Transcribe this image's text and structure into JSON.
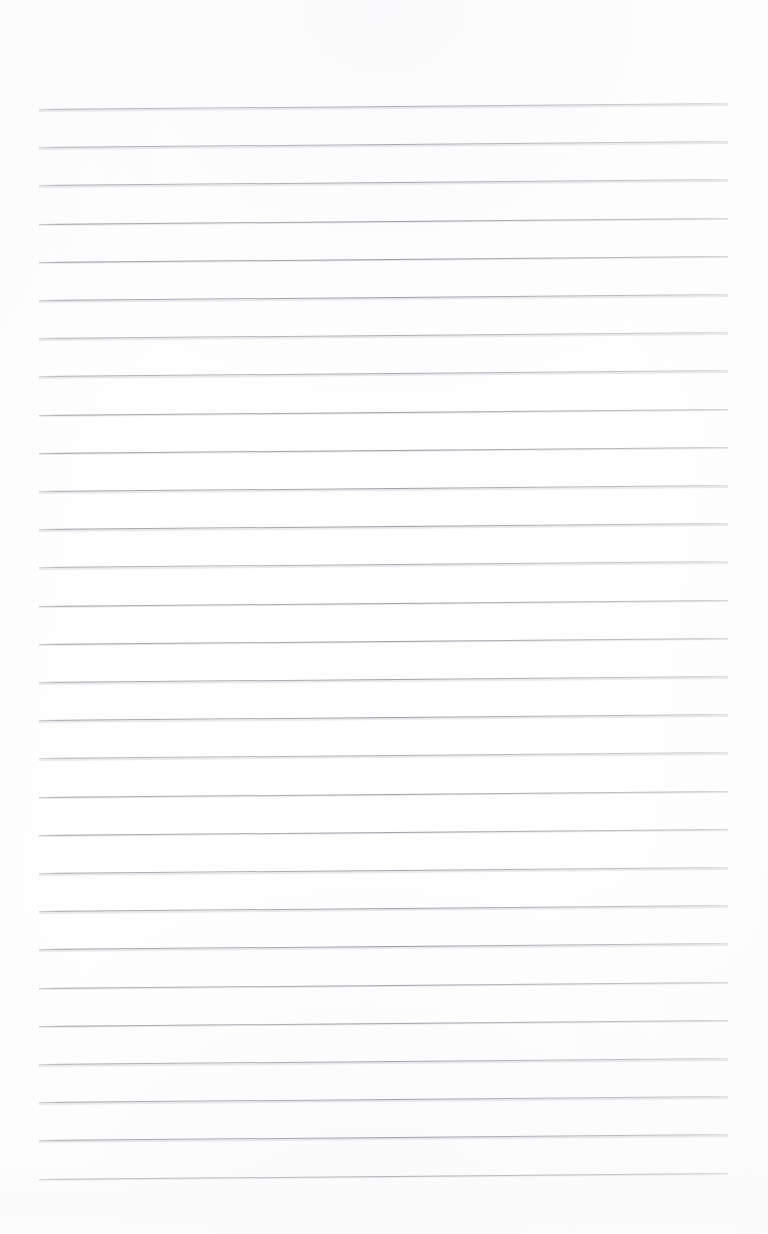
{
  "document": {
    "type": "scanned-ruled-paper",
    "title": "Blank ruled notebook page",
    "page_width": 768,
    "page_height": 1234,
    "background_color": "#fdfdfd",
    "content_text": "",
    "has_handwriting": false,
    "has_printed_text": false
  },
  "ruling": {
    "line_color": "#9c9ca6",
    "line_count": 29,
    "first_line_y": 109,
    "line_spacing": 38.2,
    "line_left_x": 39,
    "line_right_x": 728,
    "line_thickness": 1,
    "skew_rise_px": 6.0,
    "skew_degrees": -0.54,
    "orientation": "horizontal",
    "margin_rule": "none",
    "top_margin": 109,
    "bottom_margin": 59
  },
  "scan": {
    "left_blank_margin": 39,
    "right_blank_margin": 40,
    "paper_tone": "#fcfcfd",
    "noise_band_height": 72
  }
}
